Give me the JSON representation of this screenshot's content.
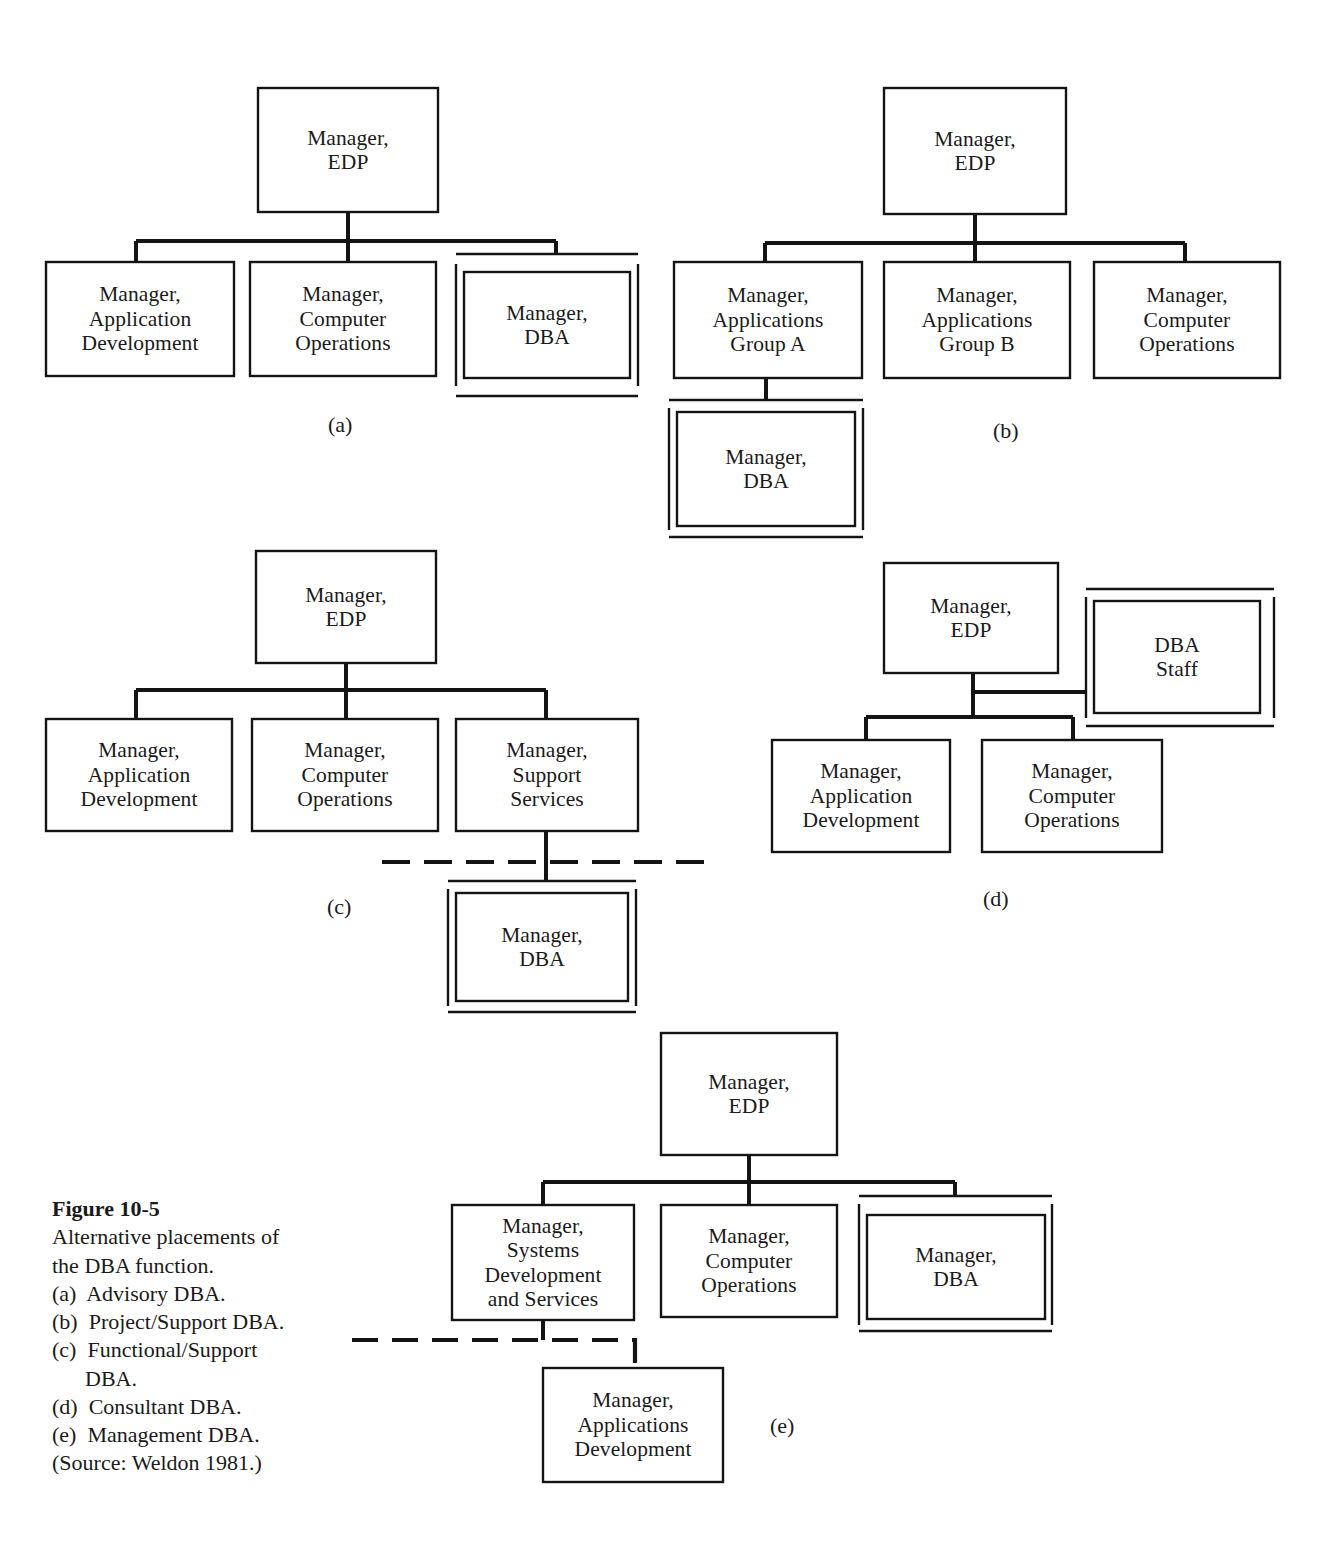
{
  "figure": {
    "title": "Figure 10-5",
    "description_line1": "Alternative placements of",
    "description_line2": "the DBA function.",
    "items": [
      "(a)  Advisory DBA.",
      "(b)  Project/Support DBA.",
      "(c)  Functional/Support",
      "      DBA.",
      "(d)  Consultant DBA.",
      "(e)  Management DBA."
    ],
    "source": "(Source: Weldon 1981.)"
  },
  "diagrams": [
    {
      "key": "a",
      "label": "(a)",
      "nodes": {
        "edp": "Manager,\nEDP",
        "appdev": "Manager,\nApplication\nDevelopment",
        "compops": "Manager,\nComputer\nOperations",
        "dba": "Manager,\nDBA"
      }
    },
    {
      "key": "b",
      "label": "(b)",
      "nodes": {
        "edp": "Manager,\nEDP",
        "groupa": "Manager,\nApplications\nGroup A",
        "groupb": "Manager,\nApplications\nGroup  B",
        "compops": "Manager,\nComputer\nOperations",
        "dba": "Manager,\nDBA"
      }
    },
    {
      "key": "c",
      "label": "(c)",
      "nodes": {
        "edp": "Manager,\nEDP",
        "appdev": "Manager,\nApplication\nDevelopment",
        "compops": "Manager,\nComputer\nOperations",
        "support": "Manager,\nSupport\nServices",
        "dba": "Manager,\nDBA"
      }
    },
    {
      "key": "d",
      "label": "(d)",
      "nodes": {
        "edp": "Manager,\nEDP",
        "dbastaff": "DBA\nStaff",
        "appdev": "Manager,\nApplication\nDevelopment",
        "compops": "Manager,\nComputer\nOperations"
      }
    },
    {
      "key": "e",
      "label": "(e)",
      "nodes": {
        "edp": "Manager,\nEDP",
        "sysdev": "Manager,\nSystems\nDevelopment\nand Services",
        "compops": "Manager,\nComputer\nOperations",
        "dba": "Manager,\nDBA",
        "appsdev": "Manager,\nApplications\nDevelopment"
      }
    }
  ],
  "style": {
    "ink": "#141414",
    "paper": "#ffffff"
  }
}
